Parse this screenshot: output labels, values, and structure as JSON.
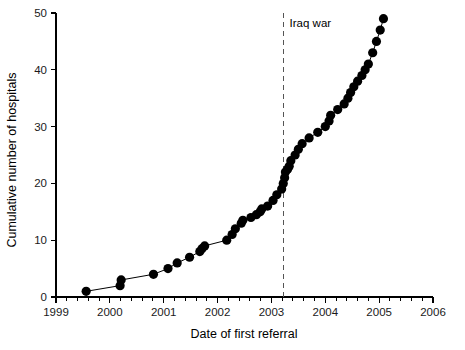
{
  "chart_data": {
    "type": "scatter",
    "title": "",
    "xlabel": "Date of first referral",
    "ylabel": "Cumulative number of hospitals",
    "xlim": [
      1999,
      2006
    ],
    "ylim": [
      0,
      50
    ],
    "x_major_ticks": [
      1999,
      2000,
      2001,
      2002,
      2003,
      2004,
      2005,
      2006
    ],
    "x_tick_labels": [
      "1999",
      "2000",
      "2001",
      "2002",
      "2003",
      "2004",
      "2005",
      "2006"
    ],
    "x_minor_interval": 0.2,
    "y_major_ticks": [
      0,
      10,
      20,
      30,
      40,
      50
    ],
    "y_tick_labels": [
      "0",
      "10",
      "20",
      "30",
      "40",
      "50"
    ],
    "grid": false,
    "legend": null,
    "marker": "filled-circle",
    "marker_size": 4.6,
    "line_style": "solid",
    "series": [
      {
        "name": "Cumulative number of hospitals",
        "x": [
          1999.56,
          2000.19,
          2000.21,
          2000.81,
          2001.08,
          2001.25,
          2001.48,
          2001.67,
          2001.71,
          2001.76,
          2002.17,
          2002.27,
          2002.33,
          2002.44,
          2002.47,
          2002.62,
          2002.72,
          2002.79,
          2002.82,
          2002.93,
          2003.03,
          2003.1,
          2003.19,
          2003.22,
          2003.245,
          2003.26,
          2003.3,
          2003.33,
          2003.36,
          2003.44,
          2003.5,
          2003.57,
          2003.7,
          2003.86,
          2004.0,
          2004.07,
          2004.1,
          2004.23,
          2004.35,
          2004.42,
          2004.47,
          2004.53,
          2004.6,
          2004.68,
          2004.74,
          2004.8,
          2004.88,
          2004.95,
          2005.02,
          2005.08
        ],
        "y": [
          1,
          2,
          3,
          4,
          5,
          6,
          7,
          8,
          8.5,
          9,
          10,
          11,
          12,
          13,
          13.5,
          14,
          14.5,
          15,
          15.5,
          16,
          17,
          18,
          19,
          20,
          21,
          22,
          22.5,
          23,
          24,
          25,
          26,
          27,
          28,
          29,
          30,
          31,
          32,
          33,
          34,
          35,
          36,
          37,
          38,
          39,
          40,
          41,
          43,
          45,
          47,
          49
        ]
      }
    ],
    "annotations": [
      {
        "name": "iraq-war-marker",
        "label": "Iraq war",
        "x": 2003.23,
        "line": "dashed-vertical",
        "label_x": 2003.3,
        "label_y": 47.5
      }
    ]
  }
}
